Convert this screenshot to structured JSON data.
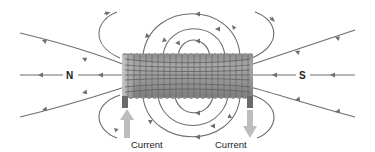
{
  "diagram": {
    "poles": {
      "north": "N",
      "south": "S"
    },
    "current_labels": {
      "left": "Current",
      "right": "Current"
    },
    "current_directions": {
      "left": "up (into coil)",
      "right": "down (out of coil)"
    },
    "field_direction": "lines exit N end (left) and enter S end (right); inside coil field runs right-to-left",
    "colors": {
      "field_line": "#6e6e6e",
      "coil_dark": "#7a7a7a",
      "coil_light": "#b8b8b8",
      "terminal": "#6a6a6a",
      "current_arrow": "#bdbdbd",
      "text": "#222222"
    }
  }
}
